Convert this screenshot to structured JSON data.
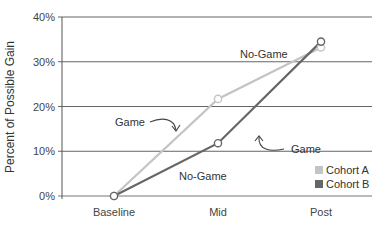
{
  "chart_data": {
    "type": "line",
    "title": "",
    "xlabel": "",
    "ylabel": "Percent of Possible Gain",
    "categories": [
      "Baseline",
      "Mid",
      "Post"
    ],
    "ylim": [
      0,
      40
    ],
    "yticks": [
      "0%",
      "10%",
      "20%",
      "30%",
      "40%"
    ],
    "grid": true,
    "legend_position": "lower right",
    "series": [
      {
        "name": "Cohort A",
        "color": "#c4c4c4",
        "values": [
          0,
          21.7,
          33.2
        ]
      },
      {
        "name": "Cohort B",
        "color": "#666666",
        "values": [
          0,
          11.8,
          34.5
        ]
      }
    ],
    "annotations": [
      {
        "text": "No-Game",
        "near": "Cohort A, Mid→Post"
      },
      {
        "text": "Game",
        "near": "Cohort A, Baseline→Mid",
        "arrow": true
      },
      {
        "text": "Game",
        "near": "Cohort B, Mid→Post",
        "arrow": true
      },
      {
        "text": "No-Game",
        "near": "Cohort B, Baseline→Mid"
      }
    ]
  },
  "labels": {
    "ylabel": "Percent of Possible Gain",
    "ann_nogame_top": "No-Game",
    "ann_game_left": "Game",
    "ann_game_right": "Game",
    "ann_nogame_bottom": "No-Game",
    "legend_a": "Cohort A",
    "legend_b": "Cohort B"
  }
}
